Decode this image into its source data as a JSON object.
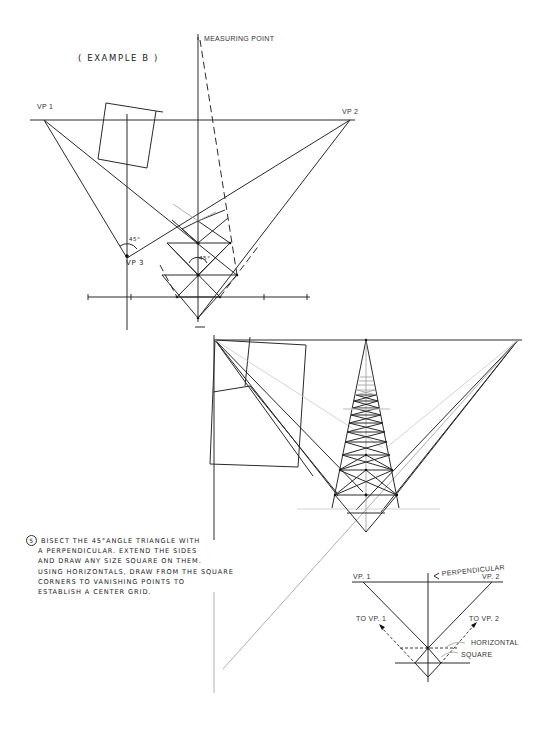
{
  "figure": {
    "example_title": "( EXAMPLE   B )",
    "labels": {
      "measuring_point": "MEASURING POINT",
      "vp1": "VP 1",
      "vp2": "VP 2",
      "vp3": "VP 3",
      "angle_45_a": "45°",
      "angle_45_b": "45°"
    }
  },
  "instructions": {
    "step_number": "5",
    "lines": [
      "BISECT THE 45°ANGLE TRIANGLE WITH",
      "A PERPENDICULAR. EXTEND THE SIDES",
      "AND DRAW ANY SIZE SQUARE ON THEM.",
      "USING HORIZONTALS, DRAW FROM THE SQUARE",
      "CORNERS TO VANISHING POINTS TO",
      "ESTABLISH A CENTER GRID."
    ]
  },
  "inset": {
    "vp1": "VP. 1",
    "vp2": "VP. 2",
    "perpendicular": "PERPENDICULAR",
    "to_vp1": "TO VP. 1",
    "to_vp2": "TO VP. 2",
    "horizontal": "HORIZONTAL",
    "square": "SQUARE"
  }
}
